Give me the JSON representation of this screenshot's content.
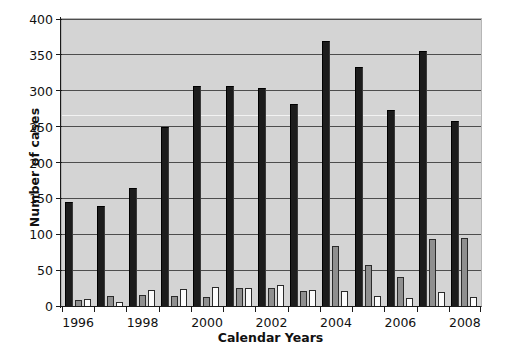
{
  "chart_data": {
    "type": "bar",
    "title": "",
    "subtitle": "",
    "xlabel": "Calendar Years",
    "ylabel": "Number of cases",
    "ylim": [
      0,
      400
    ],
    "ytick_values": [
      0,
      50,
      100,
      150,
      200,
      250,
      300,
      350,
      400
    ],
    "ytick_labels": [
      "0",
      "50",
      "100",
      "150",
      "200",
      "250",
      "300",
      "350",
      "400"
    ],
    "grid": true,
    "grid_axis": "y",
    "legend": "none",
    "legend_position": "none",
    "categories": [
      1996,
      1997,
      1998,
      1999,
      2000,
      2001,
      2002,
      2003,
      2004,
      2005,
      2006,
      2007,
      2008
    ],
    "xtick_labels": [
      "1996",
      "",
      "1998",
      "",
      "2000",
      "",
      "2002",
      "",
      "2004",
      "",
      "2006",
      "",
      "2008"
    ],
    "xtick_labels_shown": [
      "1996",
      "1998",
      "2000",
      "2002",
      "2004",
      "2006",
      "2008"
    ],
    "series": [
      {
        "name": "series-1",
        "color": "#1c1c1c",
        "values": [
          145,
          139,
          164,
          249,
          307,
          306,
          304,
          282,
          370,
          333,
          273,
          355,
          258
        ]
      },
      {
        "name": "series-2",
        "color": "#8f8f8f",
        "values": [
          9,
          14,
          15,
          14,
          12,
          25,
          25,
          21,
          84,
          57,
          40,
          93,
          95
        ]
      },
      {
        "name": "series-3",
        "color": "#fbfbfb",
        "values": [
          10,
          6,
          22,
          24,
          26,
          25,
          29,
          22,
          21,
          14,
          11,
          20,
          13
        ]
      }
    ],
    "colors": {
      "plot_background": "#d4d4d4",
      "gridline": "#4d4d4d",
      "axis": "#1a1a1a",
      "series_1": "#1c1c1c",
      "series_2": "#8f8f8f",
      "series_3": "#fbfbfb"
    }
  }
}
